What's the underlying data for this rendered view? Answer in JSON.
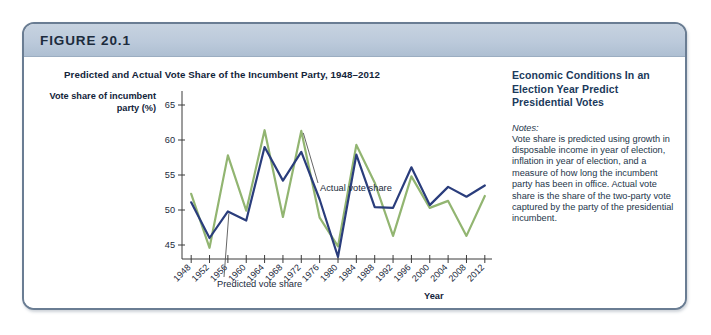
{
  "figure": {
    "number_label": "FIGURE 20.1"
  },
  "chart_block": {
    "y_axis_title": "Vote share of incumbent party (%)",
    "x_axis_title": "Year",
    "annotations": [
      {
        "name": "actual-vote-share",
        "text": "Actual vote share"
      },
      {
        "name": "predicted-vote-share",
        "text": "Predicted vote share"
      }
    ]
  },
  "side_panel": {
    "heading": "Economic Conditions In an Election Year Predict Presidential Votes",
    "notes_label": "Notes:",
    "notes_body": "Vote share is predicted using growth in disposable income in year of election, inflation in year of election, and a measure of how long the incumbent party has been in office. Actual vote share is the share of the two-party vote captured by the party of the presidential incumbent."
  },
  "chart_data": {
    "type": "line",
    "title": "Predicted and Actual Vote Share of the Incumbent Party, 1948–2012",
    "xlabel": "Year",
    "ylabel": "Vote share of incumbent party (%)",
    "x": [
      1948,
      1952,
      1956,
      1960,
      1964,
      1968,
      1972,
      1976,
      1980,
      1984,
      1988,
      1992,
      1996,
      2000,
      2004,
      2008,
      2012
    ],
    "xtick_labels": [
      "1948",
      "1952",
      "1956",
      "1960",
      "1964",
      "1968",
      "1972",
      "1976",
      "1980",
      "1984",
      "1988",
      "1992",
      "1996",
      "2000",
      "2004",
      "2008",
      "2012"
    ],
    "ytick_labels": [
      "45",
      "50",
      "55",
      "60",
      "65"
    ],
    "yticks": [
      45,
      50,
      55,
      60,
      65
    ],
    "ylim": [
      43,
      67
    ],
    "xlim": [
      1946,
      2014
    ],
    "grid": false,
    "legend": "annotations",
    "series": [
      {
        "name": "Predicted vote share",
        "color": "#2a3d7c",
        "values": [
          51.1,
          46.0,
          49.8,
          48.5,
          59.0,
          54.2,
          58.3,
          51.5,
          43.3,
          57.9,
          50.4,
          50.3,
          56.1,
          50.7,
          53.3,
          51.9,
          53.5
        ]
      },
      {
        "name": "Actual vote share",
        "color": "#92b571",
        "values": [
          52.3,
          44.6,
          57.8,
          49.9,
          61.4,
          49.0,
          61.3,
          48.9,
          44.8,
          59.3,
          53.9,
          46.3,
          54.8,
          50.3,
          51.3,
          46.3,
          52.0
        ]
      }
    ]
  }
}
